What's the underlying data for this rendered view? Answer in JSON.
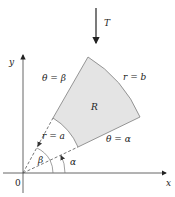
{
  "diagram": {
    "transform_label": "T",
    "axes": {
      "x_label": "x",
      "y_label": "y",
      "origin_label": "0"
    },
    "region_label": "R",
    "boundaries": {
      "outer_arc": "r = b",
      "inner_arc": "r = a",
      "ray_beta": "θ = β",
      "ray_alpha": "θ = α"
    },
    "angles": {
      "beta": "β",
      "alpha": "α"
    },
    "colors": {
      "region_fill": "#e4e4e4",
      "region_stroke": "#8a8a8a",
      "axis": "#555555"
    }
  }
}
